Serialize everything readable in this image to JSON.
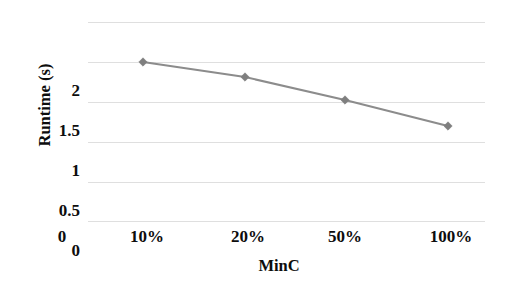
{
  "chart_data": {
    "type": "line",
    "title": "",
    "xlabel": "MinC",
    "ylabel": "Runtime (s)",
    "categories": [
      "10%",
      "20%",
      "50%",
      "100%"
    ],
    "values": [
      1.72,
      1.57,
      1.35,
      1.12
    ],
    "series": [
      {
        "name": "Runtime",
        "values": [
          1.72,
          1.57,
          1.35,
          1.12
        ],
        "color": "#8c8c8c",
        "marker": "diamond"
      }
    ],
    "x_tick_labels": [
      "0",
      "10%",
      "20%",
      "50%",
      "100%"
    ],
    "y_tick_labels": [
      "0",
      "0.5",
      "1",
      "1.5",
      "2"
    ],
    "ylim": [
      0,
      2.5
    ],
    "y_ticks": [
      0,
      0.5,
      1,
      1.5,
      2,
      2.5
    ],
    "grid": true,
    "grid_color": "#d9d9d9",
    "legend": "none",
    "line_color": "#8c8c8c",
    "marker_color": "#7f7f7f",
    "background": "#ffffff"
  },
  "axes": {
    "y_title": "Runtime (s)",
    "x_title": "MinC",
    "y_ticks": [
      {
        "label": "2",
        "top": 82
      },
      {
        "label": "1.5",
        "top": 122
      },
      {
        "label": "1",
        "top": 162
      },
      {
        "label": "0.5",
        "top": 202
      },
      {
        "label": "0",
        "top": 242
      }
    ],
    "x_ticks": [
      {
        "label": "0",
        "x": 62
      },
      {
        "label": "10%",
        "x": 147
      },
      {
        "label": "20%",
        "x": 248
      },
      {
        "label": "50%",
        "x": 345
      },
      {
        "label": "100%",
        "x": 451
      }
    ]
  },
  "gridlines": [
    22,
    62,
    102,
    142,
    182,
    221
  ],
  "points": [
    {
      "x": 55,
      "y": 42,
      "value": 1.72,
      "category": "10%"
    },
    {
      "x": 157,
      "y": 57,
      "value": 1.57,
      "category": "20%"
    },
    {
      "x": 257,
      "y": 80,
      "value": 1.35,
      "category": "50%"
    },
    {
      "x": 360,
      "y": 106,
      "value": 1.12,
      "category": "100%"
    }
  ]
}
